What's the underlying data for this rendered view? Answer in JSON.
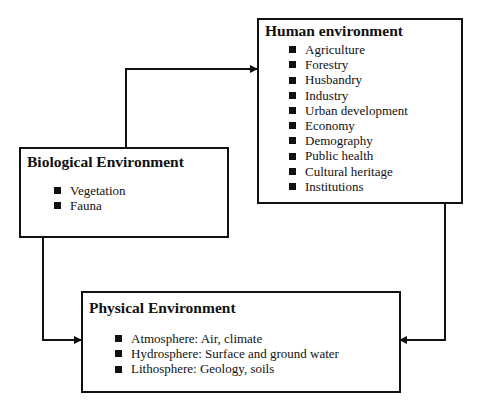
{
  "human": {
    "title": "Human environment",
    "items": [
      "Agriculture",
      "Forestry",
      "Husbandry",
      "Industry",
      "Urban development",
      "Economy",
      "Demography",
      "Public health",
      "Cultural heritage",
      "Institutions"
    ]
  },
  "biological": {
    "title": "Biological Environment",
    "items": [
      "Vegetation",
      "Fauna"
    ]
  },
  "physical": {
    "title": "Physical Environment",
    "items": [
      "Atmosphere: Air, climate",
      "Hydrosphere: Surface and ground water",
      "Lithosphere: Geology, soils"
    ]
  },
  "connections": [
    {
      "from": "biological",
      "to": "human",
      "type": "bidirectional"
    },
    {
      "from": "biological",
      "to": "physical",
      "type": "bidirectional"
    },
    {
      "from": "human",
      "to": "physical",
      "type": "bidirectional"
    }
  ]
}
